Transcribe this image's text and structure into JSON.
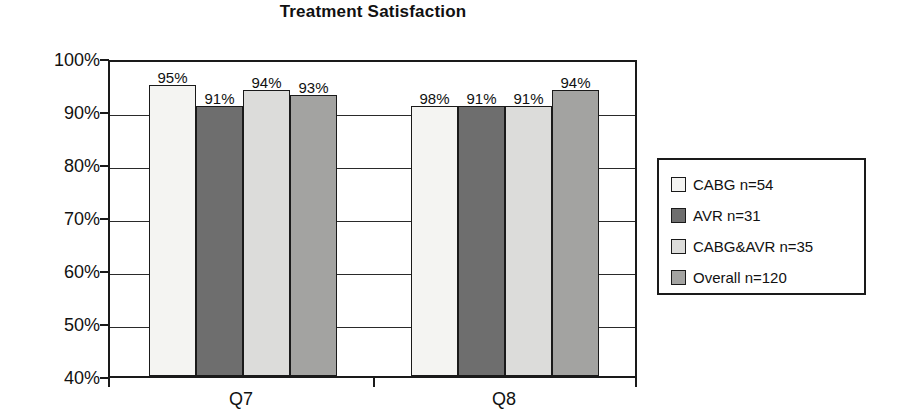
{
  "chart_data": {
    "type": "bar",
    "title": "Treatment Satisfaction",
    "xlabel": "",
    "ylabel": "",
    "categories": [
      "Q7",
      "Q8"
    ],
    "series": [
      {
        "name": "CABG n=54",
        "values": [
          95,
          91
        ],
        "color": "#f4f4f2"
      },
      {
        "name": "AVR n=31",
        "values": [
          91,
          91
        ],
        "color": "#6e6e6e"
      },
      {
        "name": "CABG&AVR n=35",
        "values": [
          94,
          91
        ],
        "color": "#dcdcda"
      },
      {
        "name": "Overall n=120",
        "values": [
          93,
          94
        ],
        "color": "#a3a3a1"
      }
    ],
    "data_labels": [
      [
        "95%",
        "91%",
        "94%",
        "93%"
      ],
      [
        "98%",
        "91%",
        "91%",
        "94%"
      ]
    ],
    "bar_values_display": {
      "Q7": [
        "95%",
        "91%",
        "94%",
        "93%"
      ],
      "Q8": [
        "98%",
        "91%",
        "91%",
        "94%"
      ]
    },
    "ylim": [
      40,
      100
    ],
    "ytick_labels": [
      "100%",
      "90%",
      "80%",
      "70%",
      "60%",
      "50%",
      "40%"
    ],
    "ytick_values": [
      100,
      90,
      80,
      70,
      60,
      50,
      40
    ],
    "grid": true,
    "legend_position": "right"
  },
  "legend": {
    "items": [
      {
        "label": "CABG n=54",
        "swatch": "#f4f4f2"
      },
      {
        "label": "AVR n=31",
        "swatch": "#6e6e6e"
      },
      {
        "label": "CABG&AVR n=35",
        "swatch": "#dcdcda"
      },
      {
        "label": "Overall n=120",
        "swatch": "#a3a3a1"
      }
    ]
  }
}
